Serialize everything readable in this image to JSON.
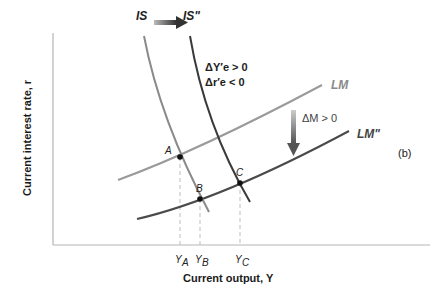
{
  "figure": {
    "panel_label": "(b)",
    "x_axis_label": "Current output, Y",
    "y_axis_label": "Current interest rate, r"
  },
  "curves": {
    "is": {
      "label": "IS",
      "color": "#8a8a8a"
    },
    "is_new": {
      "label": "IS\"",
      "color": "#444444"
    },
    "lm": {
      "label": "LM",
      "color": "#9a9a9a"
    },
    "lm_new": {
      "label": "LM\"",
      "color": "#444444"
    }
  },
  "annotations": {
    "is_shift_line1": "ΔY′e > 0",
    "is_shift_line2": "Δr′e < 0",
    "lm_shift": "ΔM > 0"
  },
  "points": {
    "a": "A",
    "b": "B",
    "c": "C"
  },
  "x_ticks": {
    "ya": "Y",
    "ya_sub": "A",
    "yb": "Y",
    "yb_sub": "B",
    "yc": "Y",
    "yc_sub": "C"
  },
  "colors": {
    "axis": "#b0b0b0",
    "arrow": "#555555",
    "dashed": "#bbbbbb",
    "point": "#111111"
  }
}
